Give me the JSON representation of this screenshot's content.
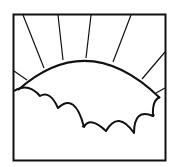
{
  "icon": {
    "semantic": "sun-rising-over-clouds",
    "stroke_color": "#111111",
    "background_color": "#ffffff"
  }
}
